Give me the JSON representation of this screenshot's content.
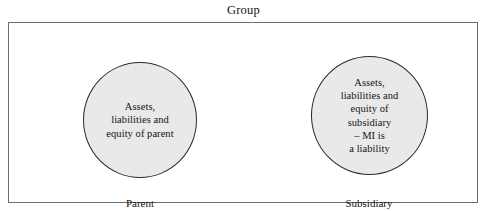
{
  "diagram": {
    "title": "Group",
    "boundary_label": "Group",
    "colors": {
      "background": "#ffffff",
      "boundary_border": "#6e6e6e",
      "boundary_fill": "#ffffff",
      "circle_fill": "#e9e9e9",
      "circle_border": "#2b2b2b",
      "text": "#141414"
    },
    "entities": [
      {
        "id": "parent",
        "label": "Parent",
        "shape": "circle",
        "content_lines": [
          "Assets,",
          "liabilities and",
          "equity of parent"
        ]
      },
      {
        "id": "subsidiary",
        "label": "Subsidiary",
        "shape": "circle",
        "content_lines": [
          "Assets,",
          "liabilities and",
          "equity of",
          "subsidiary",
          "– MI is",
          "a liability"
        ]
      }
    ]
  }
}
